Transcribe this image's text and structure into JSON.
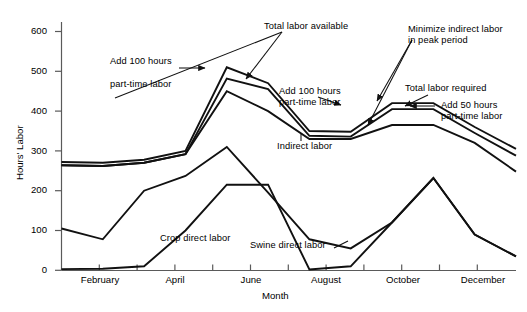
{
  "chart_data": {
    "type": "line",
    "title": "",
    "xlabel": "Month",
    "ylabel": "Hours' Labor",
    "ylim": [
      0,
      650
    ],
    "yticks": [
      0,
      100,
      200,
      300,
      400,
      500,
      600
    ],
    "ytick_labels": [
      "0",
      "100",
      "200",
      "300",
      "400",
      "500",
      "600"
    ],
    "grid": false,
    "legend": "none (inline annotations)",
    "x": [
      "January",
      "February",
      "March",
      "April",
      "May",
      "June",
      "July",
      "August",
      "September",
      "October",
      "November",
      "December"
    ],
    "xtick_labels": [
      "February",
      "April",
      "June",
      "August",
      "October",
      "December"
    ],
    "xtick_months": [
      "February",
      "April",
      "June",
      "August",
      "October",
      "December"
    ],
    "series": [
      {
        "name": "Total labor available",
        "values": [
          272,
          270,
          278,
          300,
          510,
          470,
          350,
          348,
          420,
          420,
          360,
          305
        ]
      },
      {
        "name": "Total labor required",
        "values": [
          264,
          262,
          270,
          292,
          482,
          455,
          338,
          336,
          405,
          405,
          345,
          288
        ]
      },
      {
        "name": "Indirect labor",
        "values": [
          264,
          262,
          270,
          292,
          450,
          400,
          330,
          330,
          365,
          365,
          320,
          248
        ]
      },
      {
        "name": "Crop direct labor",
        "values": [
          105,
          78,
          200,
          237,
          310,
          195,
          78,
          55,
          120,
          232,
          90,
          35
        ]
      },
      {
        "name": "Swine direct labor",
        "values": [
          3,
          4,
          10,
          100,
          215,
          215,
          2,
          10,
          120,
          232,
          90,
          35
        ]
      }
    ],
    "annotations": [
      {
        "id": "add-100-hours-spring",
        "text": "Add 100 hours\npart-time labor"
      },
      {
        "id": "total-labor-available",
        "text": "Total labor available"
      },
      {
        "id": "minimize-indirect-labor",
        "text": "Minimize indirect labor\nin peak period"
      },
      {
        "id": "add-100-hours-summer",
        "text": "Add 100 hours\npart-time labor"
      },
      {
        "id": "total-labor-required",
        "text": "Total labor required"
      },
      {
        "id": "add-50-hours",
        "text": "Add 50 hours\npart-time labor"
      },
      {
        "id": "indirect-labor",
        "text": "Indirect labor"
      },
      {
        "id": "crop-direct-labor",
        "text": "Crop direct labor"
      },
      {
        "id": "swine-direct-labor",
        "text": "Swine direct labor"
      }
    ],
    "colors": {
      "line": "#1a1a1a",
      "axis": "#4d4d4d",
      "background": "#ffffff"
    }
  },
  "axes": {
    "y_label": "Hours' Labor",
    "x_label": "Month",
    "y_ticks": [
      "600",
      "500",
      "400",
      "300",
      "200",
      "100",
      "0"
    ],
    "x_ticks": [
      "February",
      "April",
      "June",
      "August",
      "October",
      "December"
    ]
  },
  "annotations": {
    "add_100_spring_line1": "Add 100 hours",
    "add_100_spring_line2": "part-time labor",
    "total_available": "Total labor available",
    "minimize_line1": "Minimize indirect labor",
    "minimize_line2": "in peak period",
    "add_100_summer_line1": "Add 100 hours",
    "add_100_summer_line2": "part-time labor",
    "total_required": "Total labor required",
    "add_50_line1": "Add 50 hours",
    "add_50_line2": "part-time labor",
    "indirect": "Indirect labor",
    "crop": "Crop direct labor",
    "swine": "Swine direct labor"
  }
}
